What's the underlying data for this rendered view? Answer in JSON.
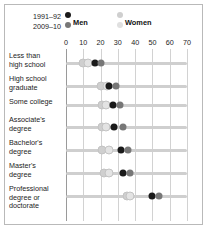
{
  "legend": {
    "year_old": "1991–92",
    "year_new": "2009–10",
    "series": [
      {
        "name": "Men",
        "color_old": "#1a1a1a",
        "color_new": "#777777"
      },
      {
        "name": "Women",
        "color_old": "#cfcfcf",
        "color_new": "#e0e0e0"
      }
    ]
  },
  "colors": {
    "men_old": "#1a1a1a",
    "men_new": "#777777",
    "women_old": "#cfcfcf",
    "women_new": "#e3e3e3",
    "track": "#cfcfcf",
    "grid": "#d2d2d2",
    "border": "#b9b9b9",
    "text": "#1c1c1c"
  },
  "chart_data": {
    "type": "scatter",
    "title": "",
    "subtitle": "",
    "xlabel": "",
    "ylabel": "",
    "xlim": [
      0,
      70
    ],
    "xticks": [
      0,
      10,
      20,
      30,
      40,
      50,
      60,
      70
    ],
    "ticklabels": [
      "0",
      "10",
      "20",
      "30",
      "40",
      "50",
      "60",
      "70"
    ],
    "grid": true,
    "legend_position": "top-left",
    "categories": [
      "Less than high school",
      "High school graduate",
      "Some college",
      "Associate's degree",
      "Bachelor's degree",
      "Master's degree",
      "Professional degree or doctorate"
    ],
    "series": [
      {
        "name": "Men 1991–92",
        "key": "men_old",
        "values": [
          17,
          25,
          27,
          28,
          32,
          33,
          50
        ]
      },
      {
        "name": "Men 2009–10",
        "key": "men_new",
        "values": [
          20,
          29,
          31,
          33,
          36,
          37,
          54
        ]
      },
      {
        "name": "Women 1991–92",
        "key": "women_old",
        "values": [
          10,
          20,
          21,
          21,
          21,
          22,
          35
        ]
      },
      {
        "name": "Women 2009–10",
        "key": "women_new",
        "values": [
          13,
          24,
          23,
          23,
          25,
          25,
          37
        ]
      }
    ]
  },
  "row_labels": [
    [
      "Less than",
      "high school"
    ],
    [
      "High school",
      "graduate"
    ],
    [
      "Some college"
    ],
    [
      "Associate's",
      "degree"
    ],
    [
      "Bachelor's",
      "degree"
    ],
    [
      "Master's",
      "degree"
    ],
    [
      "Professional",
      "degree or",
      "doctorate"
    ]
  ]
}
